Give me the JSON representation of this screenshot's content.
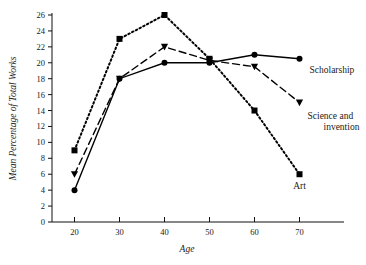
{
  "chart_data": {
    "type": "line",
    "title": "",
    "xlabel": "Age",
    "ylabel": "Mean Percentage of Total Works",
    "x": [
      20,
      30,
      40,
      50,
      60,
      70
    ],
    "xticks": [
      "20",
      "30",
      "40",
      "50",
      "60",
      "70"
    ],
    "yticks": [
      "0",
      "2",
      "4",
      "6",
      "8",
      "10",
      "12",
      "14",
      "16",
      "18",
      "20",
      "22",
      "24",
      "26"
    ],
    "xlim": [
      15,
      75
    ],
    "ylim": [
      0,
      26
    ],
    "grid": false,
    "legend_position": "inline-right-of-line-ends",
    "series": [
      {
        "name": "Art",
        "values": [
          9,
          23,
          26,
          20.5,
          14,
          6
        ],
        "marker": "square",
        "linestyle": "dotted",
        "color": "#000000",
        "label_text": "Art"
      },
      {
        "name": "Science and invention",
        "values": [
          6,
          18,
          22,
          20.3,
          19.5,
          15
        ],
        "marker": "triangle-down",
        "linestyle": "dashed",
        "color": "#000000",
        "label_text": "Science and invention",
        "label_line1": "Science and",
        "label_line2": "invention"
      },
      {
        "name": "Scholarship",
        "values": [
          4,
          18,
          20,
          20,
          21,
          20.5
        ],
        "marker": "circle",
        "linestyle": "solid",
        "color": "#000000",
        "label_text": "Scholarship"
      }
    ]
  }
}
